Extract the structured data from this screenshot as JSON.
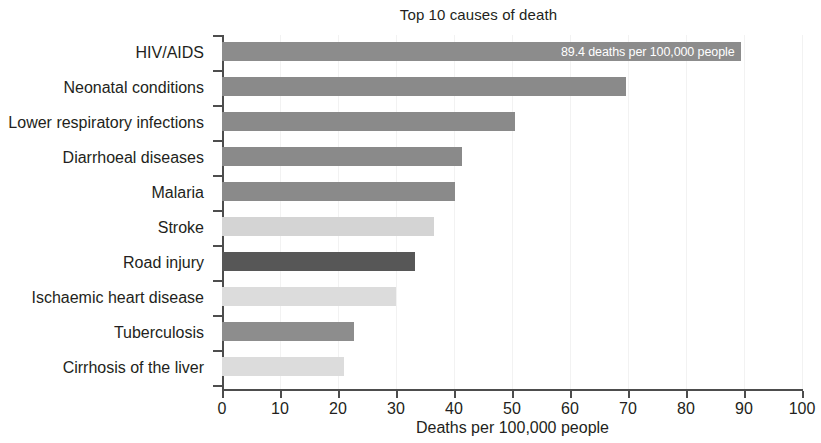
{
  "chart_data": {
    "type": "bar",
    "orientation": "horizontal",
    "title": "Top 10 causes of death",
    "xlabel": "Deaths per 100,000 people",
    "ylabel": "",
    "xlim": [
      0,
      100
    ],
    "xticks": [
      0,
      10,
      20,
      30,
      40,
      50,
      60,
      70,
      80,
      90,
      100
    ],
    "xtick_labels": [
      "0",
      "10",
      "20",
      "30",
      "40",
      "50",
      "60",
      "70",
      "80",
      "90",
      "100"
    ],
    "grid": false,
    "legend": "none",
    "categories": [
      "HIV/AIDS",
      "Neonatal conditions",
      "Lower respiratory infections",
      "Diarrhoeal diseases",
      "Malaria",
      "Stroke",
      "Road injury",
      "Ischaemic heart disease",
      "Tuberculosis",
      "Cirrhosis of the liver"
    ],
    "values": [
      89.4,
      69.7,
      50.5,
      41.3,
      40.1,
      36.5,
      33.2,
      30.0,
      22.8,
      21.0
    ],
    "bar_colors": [
      "#8c8c8c",
      "#8a8a8a",
      "#8a8a8a",
      "#8a8a8a",
      "#8a8a8a",
      "#d4d4d4",
      "#575757",
      "#dcdcdc",
      "#8d8d8d",
      "#dcdcdc"
    ],
    "annotations": [
      {
        "category": "HIV/AIDS",
        "text": "89.4 deaths per 100,000 people",
        "position": "inside-end",
        "color": "#ffffff"
      }
    ],
    "axis_color": "#4d4d4d",
    "text_color": "#231f20",
    "background": "#ffffff"
  }
}
